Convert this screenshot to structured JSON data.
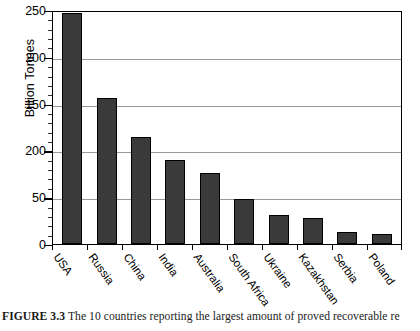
{
  "figure": {
    "caption_label": "FIGURE 3.3",
    "caption_text": "The 10 countries reporting the largest amount of proved recoverable re"
  },
  "axes": {
    "ylabel": "Billion Tonnes",
    "ytick_labels": [
      "250",
      "200",
      "150",
      "200",
      "50",
      "0"
    ],
    "ytick_values": [
      250,
      200,
      150,
      100,
      50,
      0
    ],
    "ymin": 0,
    "ymax": 250,
    "minor_tick_step": 10,
    "xtick_labels": [
      "USA",
      "Russia",
      "China",
      "India",
      "Australia",
      "South Africa",
      "Ukraine",
      "Kazakhstan",
      "Serbia",
      "Poland"
    ]
  },
  "style": {
    "bar_fill": "#3a3a3a",
    "bar_stroke": "#000000",
    "grid_color": "#9a9a9a",
    "frame_color": "#000000",
    "background": "#ffffff"
  },
  "chart_data": {
    "type": "bar",
    "title": "",
    "xlabel": "",
    "ylabel": "Billion Tonnes",
    "ylim": [
      0,
      250
    ],
    "grid": true,
    "legend": "none",
    "categories": [
      "USA",
      "Russia",
      "China",
      "India",
      "Australia",
      "South Africa",
      "Ukraine",
      "Kazakhstan",
      "Serbia",
      "Poland"
    ],
    "values": [
      247,
      156,
      114,
      90,
      76,
      48,
      31,
      28,
      13,
      11
    ],
    "ytick_labels_as_printed": [
      "250",
      "200",
      "150",
      "200",
      "50",
      "0"
    ],
    "note": "The fourth y-axis label is printed as '200' in the source figure where the 100 gridline falls."
  }
}
